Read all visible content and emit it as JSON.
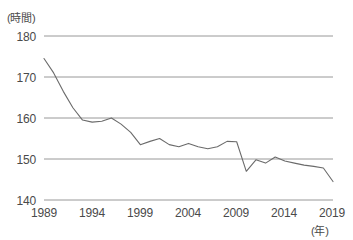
{
  "chart_data": {
    "type": "line",
    "title": "",
    "subtitle": "",
    "xlabel": "(年)",
    "ylabel": "(時間)",
    "xlim": [
      1989,
      2019
    ],
    "ylim": [
      140,
      180
    ],
    "grid": true,
    "legend": null,
    "y_ticks": [
      180,
      170,
      160,
      150,
      140
    ],
    "x_ticks": [
      1989,
      1994,
      1999,
      2004,
      2009,
      2014,
      2019
    ],
    "line_color": "#6b6b6b",
    "grid_color": "#8c8c8c",
    "series": [
      {
        "name": "月間総実労働時間",
        "x": [
          1989,
          1990,
          1991,
          1992,
          1993,
          1994,
          1995,
          1996,
          1997,
          1998,
          1999,
          2000,
          2001,
          2002,
          2003,
          2004,
          2005,
          2006,
          2007,
          2008,
          2009,
          2010,
          2011,
          2012,
          2013,
          2014,
          2015,
          2016,
          2017,
          2018,
          2019
        ],
        "values": [
          174.5,
          171.0,
          166.5,
          162.5,
          159.5,
          159.0,
          159.2,
          160.0,
          158.5,
          156.5,
          153.5,
          154.3,
          155.0,
          153.5,
          153.0,
          153.8,
          153.0,
          152.5,
          153.0,
          154.3,
          154.2,
          147.0,
          149.8,
          149.0,
          150.5,
          149.5,
          149.0,
          148.5,
          148.2,
          147.8,
          144.5
        ]
      }
    ]
  },
  "axes": {
    "y_unit": "(時間)",
    "x_unit": "(年)",
    "y_tick_labels": [
      "180",
      "170",
      "160",
      "150",
      "140"
    ],
    "x_tick_labels": [
      "1989",
      "1994",
      "1999",
      "2004",
      "2009",
      "2014",
      "2019"
    ]
  }
}
